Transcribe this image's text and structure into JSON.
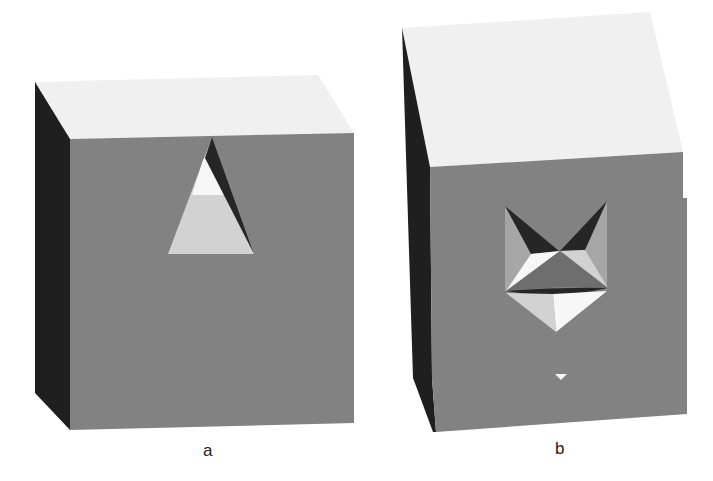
{
  "figure": {
    "panels": [
      {
        "id": "a",
        "label": "a"
      },
      {
        "id": "b",
        "label": "b"
      }
    ]
  },
  "colors": {
    "background": "#ffffff",
    "top_face": "#f0f0f0",
    "front_face": "#828282",
    "side_face": "#1f1f1f",
    "facet_light": "#d2d2d2",
    "facet_white": "#f7f7f7",
    "facet_mid": "#6e6e6e",
    "facet_dark": "#262626",
    "facet_pale": "#a6a6a6",
    "label_text": "#222222"
  }
}
